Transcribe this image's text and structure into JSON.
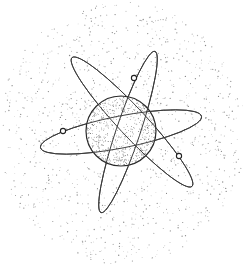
{
  "illustration": {
    "subject": "atom",
    "description": "Line-art drawing of an atom: a stippled spherical nucleus with three elliptical electron orbits, each carrying one small circular electron, surrounded by a speckled dot cloud.",
    "colors": {
      "background": "#ffffff",
      "ink": "#2a2a2a",
      "stipple": "#555555"
    },
    "nucleus": {
      "cx": 121,
      "cy": 131,
      "r": 35
    },
    "orbits": [
      {
        "name": "orbit-horizontal",
        "cx": 121,
        "cy": 132,
        "rx": 82,
        "ry": 16,
        "angle": -11
      },
      {
        "name": "orbit-diagonal-down",
        "cx": 132,
        "cy": 122,
        "rx": 88,
        "ry": 14,
        "angle": 47
      },
      {
        "name": "orbit-diagonal-up",
        "cx": 128,
        "cy": 132,
        "rx": 85,
        "ry": 12,
        "angle": -71.5
      }
    ],
    "electrons": [
      {
        "name": "electron-top",
        "cx": 134,
        "cy": 78,
        "r": 2.6
      },
      {
        "name": "electron-left",
        "cx": 63,
        "cy": 131,
        "r": 2.6
      },
      {
        "name": "electron-right",
        "cx": 179,
        "cy": 156,
        "r": 2.6
      }
    ]
  }
}
